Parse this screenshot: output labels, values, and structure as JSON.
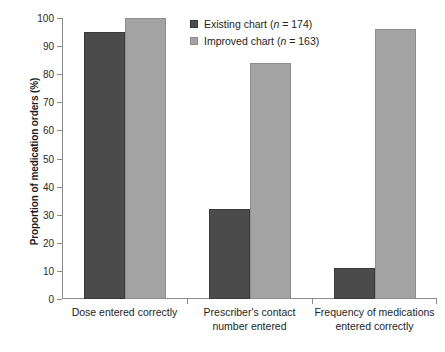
{
  "chart_data": {
    "type": "bar",
    "title": "",
    "xlabel": "",
    "ylabel": "Proportion of medication orders (%)",
    "ylim": [
      0,
      100
    ],
    "ytick_step": 10,
    "yticks": [
      0,
      10,
      20,
      30,
      40,
      50,
      60,
      70,
      80,
      90,
      100
    ],
    "grid": false,
    "legend_position": "top-center",
    "categories": [
      "Dose entered correctly",
      "Prescriber's contact number entered",
      "Frequency of medications entered correctly"
    ],
    "category_lines": [
      [
        "Dose entered correctly"
      ],
      [
        "Prescriber's contact",
        "number entered"
      ],
      [
        "Frequency of medications",
        "entered correctly"
      ]
    ],
    "series": [
      {
        "name": "Existing chart",
        "n": 174,
        "legend_label": "Existing chart (n = 174)",
        "color": "#4b4b4b",
        "values": [
          95,
          32,
          11
        ]
      },
      {
        "name": "Improved chart",
        "n": 163,
        "legend_label": "Improved chart (n = 163)",
        "color": "#a3a3a3",
        "values": [
          100,
          84,
          96
        ]
      }
    ]
  },
  "legend": {
    "rows": [
      {
        "pre": "Existing chart (",
        "italic": "n",
        "post": " = 174)"
      },
      {
        "pre": "Improved chart (",
        "italic": "n",
        "post": " = 163)"
      }
    ]
  },
  "axis": {
    "y_title": "Proportion of medication orders (%)",
    "y_labels": [
      "0",
      "10",
      "20",
      "30",
      "40",
      "50",
      "60",
      "70",
      "80",
      "90",
      "100"
    ]
  }
}
